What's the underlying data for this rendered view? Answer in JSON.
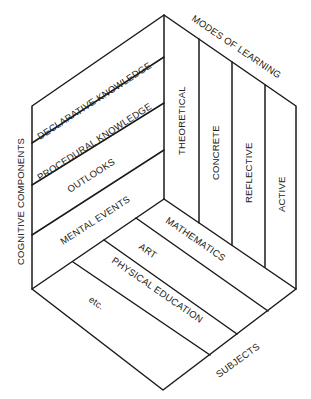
{
  "diagram": {
    "type": "three-dimensional cube model",
    "axes": {
      "left_face_axis": "COGNITIVE COMPONENTS",
      "right_face_axis": "MODES OF LEARNING",
      "bottom_face_axis": "SUBJECTS"
    },
    "cognitive_components": [
      "DECLARATIVE KNOWLEDGE",
      "PROCEDURAL KNOWLEDGE",
      "OUTLOOKS",
      "MENTAL EVENTS"
    ],
    "modes_of_learning": [
      "THEORETICAL",
      "CONCRETE",
      "REFLECTIVE",
      "ACTIVE"
    ],
    "subjects": [
      "MATHEMATICS",
      "ART",
      "PHYSICAL EDUCATION",
      "etc."
    ]
  }
}
